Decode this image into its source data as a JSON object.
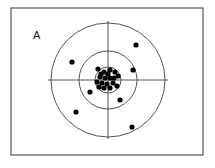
{
  "figure": {
    "panel_label": "A",
    "background_color": "#ffffff",
    "stroke_color": "#555555",
    "point_color": "#000000",
    "frame": {
      "x": 11,
      "y": 8,
      "width": 192,
      "height": 147,
      "stroke_width": 1.2
    },
    "label_position": {
      "x": 33,
      "y": 39
    }
  },
  "chart_data": {
    "type": "scatter",
    "title": "A",
    "subtitle": "",
    "xlabel": "",
    "ylabel": "",
    "grid": false,
    "legend": "none",
    "xlim": [
      11,
      203
    ],
    "ylim": [
      8,
      155
    ],
    "target": {
      "center": {
        "x": 108,
        "y": 80
      },
      "rings": [
        {
          "name": "inner-ring",
          "radius": 13
        },
        {
          "name": "middle-ring",
          "radius": 29
        },
        {
          "name": "outer-ring",
          "radius": 57
        }
      ],
      "crosshair": {
        "horizontal": {
          "x1": 48,
          "y1": 80,
          "x2": 168,
          "y2": 80
        },
        "vertical": {
          "x1": 108,
          "y1": 21,
          "x2": 108,
          "y2": 139
        }
      }
    },
    "point_radius": 2.6,
    "series": [
      {
        "name": "outliers",
        "values": [
          {
            "x": 136,
            "y": 45
          },
          {
            "x": 72,
            "y": 62
          },
          {
            "x": 133,
            "y": 70
          },
          {
            "x": 76,
            "y": 112
          },
          {
            "x": 120,
            "y": 100
          },
          {
            "x": 132,
            "y": 127
          },
          {
            "x": 98,
            "y": 69
          },
          {
            "x": 90,
            "y": 92
          }
        ]
      },
      {
        "name": "central-cluster",
        "values": [
          {
            "x": 104,
            "y": 72
          },
          {
            "x": 110,
            "y": 70
          },
          {
            "x": 115,
            "y": 72
          },
          {
            "x": 118,
            "y": 76
          },
          {
            "x": 100,
            "y": 77
          },
          {
            "x": 105,
            "y": 78
          },
          {
            "x": 110,
            "y": 78
          },
          {
            "x": 97,
            "y": 82
          },
          {
            "x": 102,
            "y": 83
          },
          {
            "x": 107,
            "y": 84
          },
          {
            "x": 113,
            "y": 83
          },
          {
            "x": 117,
            "y": 86
          },
          {
            "x": 104,
            "y": 88
          },
          {
            "x": 110,
            "y": 88
          },
          {
            "x": 99,
            "y": 87
          },
          {
            "x": 114,
            "y": 78
          },
          {
            "x": 108,
            "y": 74
          },
          {
            "x": 101,
            "y": 74
          }
        ]
      }
    ],
    "counts": {
      "total_points": 26,
      "outliers": 8,
      "central_cluster": 18
    }
  }
}
